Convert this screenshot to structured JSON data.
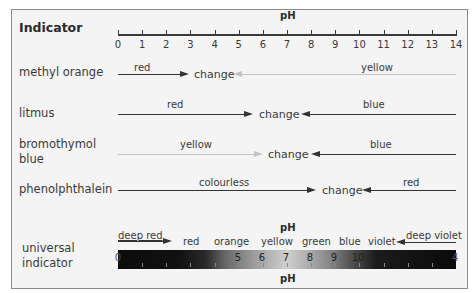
{
  "title": "Indicator",
  "axis": {
    "label": "pH",
    "ticks": [
      "0",
      "1",
      "2",
      "3",
      "4",
      "5",
      "6",
      "7",
      "8",
      "9",
      "10",
      "11",
      "12",
      "13",
      "14"
    ]
  },
  "indicators": [
    {
      "name": "methyl orange",
      "acid_colour": "red",
      "change_label": "change",
      "base_colour": "yellow",
      "acid_end_pH": 3.1,
      "base_start_pH": 4.4
    },
    {
      "name": "litmus",
      "acid_colour": "red",
      "change_label": "change",
      "base_colour": "blue",
      "acid_end_pH": 5.5,
      "base_start_pH": 7.0
    },
    {
      "name_line1": "bromothymol",
      "name_line2": "blue",
      "acid_colour": "yellow",
      "change_label": "change",
      "base_colour": "blue",
      "acid_end_pH": 6.0,
      "base_start_pH": 7.6
    },
    {
      "name": "phenolphthalein",
      "acid_colour": "colourless",
      "change_label": "change",
      "base_colour": "red",
      "acid_end_pH": 8.2,
      "base_start_pH": 10.0
    }
  ],
  "universal": {
    "name_line1": "universal",
    "name_line2": "indicator",
    "ph_label_top": "pH",
    "ph_label_bottom": "pH",
    "deep_red": "deep red",
    "deep_violet": "deep violet",
    "colours": [
      "red",
      "orange",
      "yellow",
      "green",
      "blue",
      "violet"
    ],
    "bar_numbers": [
      "0",
      "5",
      "6",
      "7",
      "8",
      "9",
      "10",
      "4"
    ]
  },
  "colors": {
    "panel_bg": "#f4f4f4",
    "border": "#8a8a8a",
    "dark_line": "#333333",
    "light_line": "#bdbdbd",
    "text": "#3a3a3a"
  }
}
